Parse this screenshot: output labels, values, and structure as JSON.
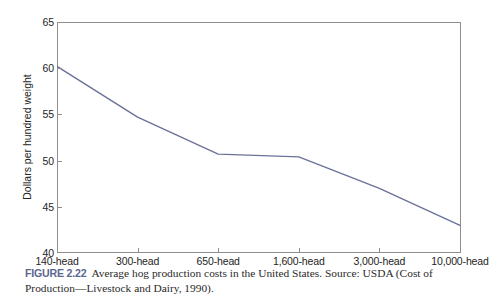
{
  "figure": {
    "caption_label": "FIGURE 2.22",
    "caption_text": "Average hog production costs in the United States. Source: USDA (Cost of Production—Livestock and Dairy, 1990)."
  },
  "colors": {
    "line": "#6b7299",
    "axis": "#8e8e8e",
    "text": "#242424",
    "caption_label": "#5c6790",
    "background": "#ffffff"
  },
  "chart_data": {
    "type": "line",
    "title": "",
    "xlabel": "",
    "ylabel": "Dollars per hundred weight",
    "categories": [
      "140-head",
      "300-head",
      "650-head",
      "1,600-head",
      "3,000-head",
      "10,000-head"
    ],
    "values": [
      60.2,
      54.7,
      50.7,
      50.4,
      47.0,
      43.0
    ],
    "series": [
      {
        "name": "Average hog production cost",
        "values": [
          60.2,
          54.7,
          50.7,
          50.4,
          47.0,
          43.0
        ]
      }
    ],
    "ylim": [
      40,
      65
    ],
    "yticks": [
      40,
      45,
      50,
      55,
      60,
      65
    ],
    "ytick_labels": [
      "40",
      "45",
      "50",
      "55",
      "60",
      "65"
    ],
    "grid": false,
    "legend": "none"
  }
}
